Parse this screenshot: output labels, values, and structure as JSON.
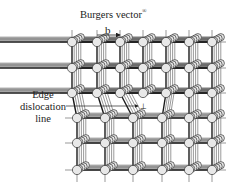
{
  "title": "Burgers vector",
  "title_mark": "®",
  "burgers_symbol": "b",
  "edge_label": [
    "Edge",
    "dislocation",
    "line"
  ],
  "dislocation_symbol": "⊥",
  "lattice": {
    "columns": 7,
    "rows": 6,
    "colors": {
      "atom_fill": "#e8e8e8",
      "atom_stroke": "#333333",
      "bond": "#555555",
      "bond_heavy": "#1a1a1a"
    }
  }
}
